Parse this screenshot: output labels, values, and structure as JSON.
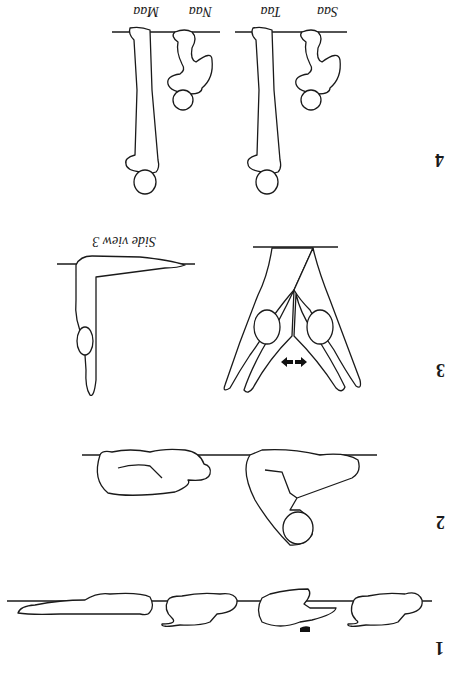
{
  "figure": {
    "orientation": "rotated-180",
    "panels": [
      {
        "number": "1",
        "description": "crawling sequence along a line"
      },
      {
        "number": "2",
        "description": "curled sitting postures on a line"
      },
      {
        "number": "3",
        "description": "splayed legs with two heads, arrows indicating spreading",
        "side_label": "Side view 3"
      },
      {
        "number": "4",
        "labels": [
          "Saa",
          "Taa",
          "Naa",
          "Maa"
        ],
        "description": "hanging figures from a bar"
      }
    ],
    "arrow_glyphs": [
      "arrow-left-icon",
      "arrow-right-icon"
    ]
  }
}
